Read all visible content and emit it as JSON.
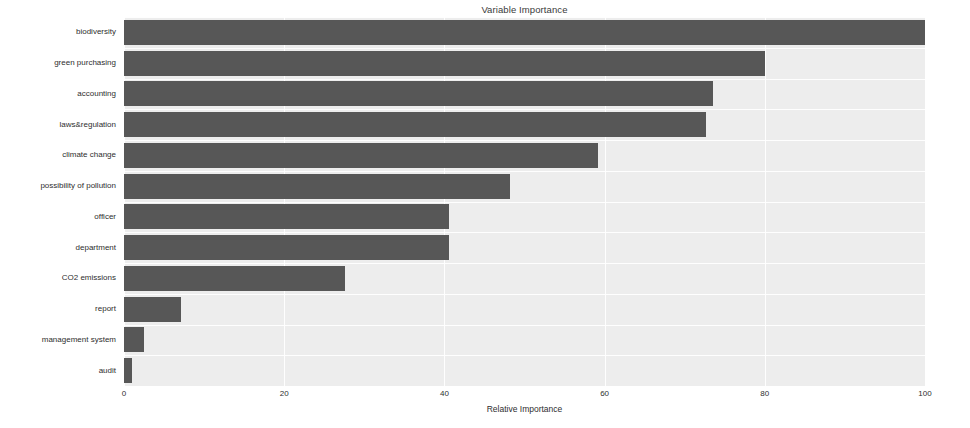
{
  "chart_data": {
    "type": "bar",
    "orientation": "horizontal",
    "title": "Variable Importance",
    "xlabel": "Relative Importance",
    "ylabel": "",
    "xlim": [
      0,
      100
    ],
    "xticks": [
      0,
      20,
      40,
      60,
      80,
      100
    ],
    "grid": true,
    "legend": null,
    "bar_color": "#575757",
    "plot_background": "#ededed",
    "figure_background": "#ffffff",
    "grid_color": "#ffffff",
    "categories": [
      "biodiversity",
      "green purchasing",
      "accounting",
      "laws&regulation",
      "climate change",
      "possibility of pollution",
      "officer",
      "department",
      "CO2 emissions",
      "report",
      "management system",
      "audit"
    ],
    "values": [
      100.0,
      80.0,
      73.5,
      72.7,
      59.2,
      48.2,
      40.6,
      40.6,
      27.6,
      7.1,
      2.5,
      1.0
    ],
    "series": [
      {
        "name": "Relative Importance",
        "values": [
          100.0,
          80.0,
          73.5,
          72.7,
          59.2,
          48.2,
          40.6,
          40.6,
          27.6,
          7.1,
          2.5,
          1.0
        ]
      }
    ]
  }
}
